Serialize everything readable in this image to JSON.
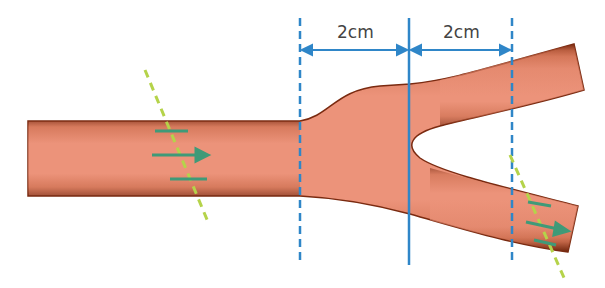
{
  "diagram": {
    "dimensions": [
      {
        "label": "2cm",
        "between": [
          "inlet-expansion-plane",
          "bifurcation-plane"
        ]
      },
      {
        "label": "2cm",
        "between": [
          "bifurcation-plane",
          "outlet-plane"
        ]
      }
    ],
    "colors": {
      "vessel": "#e58a6c",
      "vessel_edge": "#8a3418",
      "guide_line": "#2f86c8",
      "flow_arrow": "#3f9a78",
      "section_line": "#b5d34a"
    },
    "planes": [
      {
        "name": "expansion-start",
        "style": "dashed"
      },
      {
        "name": "bifurcation",
        "style": "solid"
      },
      {
        "name": "outlet",
        "style": "dashed"
      }
    ],
    "flow_markers": [
      {
        "location": "inlet-vessel",
        "direction": "right"
      },
      {
        "location": "lower-branch",
        "direction": "right"
      }
    ]
  }
}
